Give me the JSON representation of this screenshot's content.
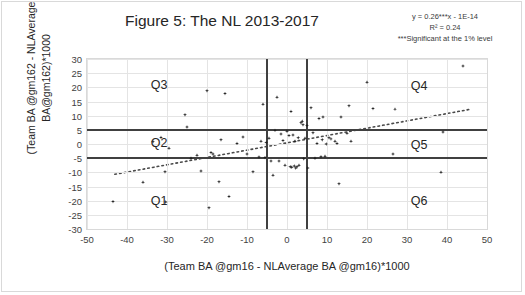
{
  "title": "Figure 5: The NL 2013-2017",
  "annotation": {
    "equation": "y = 0.26***x - 1E-14",
    "r_squared": "R² = 0.24",
    "significance": "***Significant at the 1% level"
  },
  "axis_titles": {
    "y_line1": "(Team BA @gm162 - NLAverage",
    "y_line2": "BA@gm162)*1000",
    "x": "(Team BA @gm16 - NLAverage BA @gm16)*1000"
  },
  "quadrant_labels": [
    {
      "name": "Q3",
      "text": "Q3",
      "x": -32,
      "y": 21
    },
    {
      "name": "Q2",
      "text": "Q2",
      "x": -32,
      "y": 0.5
    },
    {
      "name": "Q1",
      "text": "Q1",
      "x": -32,
      "y": -20
    },
    {
      "name": "Q4",
      "text": "Q4",
      "x": 33,
      "y": 20.5
    },
    {
      "name": "Q5",
      "text": "Q5",
      "x": 33,
      "y": -0.5
    },
    {
      "name": "Q6",
      "text": "Q6",
      "x": 33,
      "y": -20
    }
  ],
  "chart_data": {
    "type": "scatter",
    "title": "Figure 5: The NL 2013-2017",
    "xlabel": "(Team BA @gm16 - NLAverage BA @gm16)*1000",
    "ylabel": "(Team BA @gm162 - NLAverage BA@gm162)*1000",
    "xlim": [
      -50,
      50
    ],
    "ylim": [
      -30,
      30
    ],
    "xticks": [
      -50,
      -40,
      -30,
      -20,
      -10,
      0,
      10,
      20,
      30,
      40,
      50
    ],
    "yticks": [
      -30,
      -25,
      -20,
      -15,
      -10,
      -5,
      0,
      5,
      10,
      15,
      20,
      25,
      30
    ],
    "grid": true,
    "legend": false,
    "marker": "diamond",
    "marker_color": "#1a1a1a",
    "reference_lines": {
      "horizontal": [
        5,
        -5
      ],
      "vertical": [
        -5,
        5
      ],
      "color": "#404040"
    },
    "trendline": {
      "style": "dotted",
      "color": "#4a4a4a",
      "slope": 0.26,
      "intercept": 0,
      "equation": "y = 0.26***x - 1E-14",
      "r_squared": 0.24,
      "x_start": -43,
      "x_end": 46
    },
    "points": [
      [
        -43.5,
        -20.3
      ],
      [
        -36.0,
        -13.5
      ],
      [
        -33.5,
        0.8
      ],
      [
        -31.5,
        2.3
      ],
      [
        -30.5,
        -9.8
      ],
      [
        -30.3,
        -20.5
      ],
      [
        -29.5,
        -1.5
      ],
      [
        -25.5,
        10.3
      ],
      [
        -25.0,
        6.0
      ],
      [
        -24.0,
        -5.0
      ],
      [
        -22.5,
        -4.0
      ],
      [
        -21.5,
        -9.5
      ],
      [
        -20.0,
        18.8
      ],
      [
        -19.5,
        -22.5
      ],
      [
        -19.0,
        -3.0
      ],
      [
        -18.5,
        -3.5
      ],
      [
        -17.0,
        -13.3
      ],
      [
        -16.5,
        1.5
      ],
      [
        -15.5,
        17.8
      ],
      [
        -14.5,
        -18.5
      ],
      [
        -12.5,
        0.2
      ],
      [
        -11.0,
        2.5
      ],
      [
        -10.0,
        -3.5
      ],
      [
        -8.5,
        -9.8
      ],
      [
        -7.0,
        -4.6
      ],
      [
        -6.5,
        1.0
      ],
      [
        -6.0,
        14.0
      ],
      [
        -5.5,
        -4.8
      ],
      [
        -5.2,
        0.5
      ],
      [
        -4.5,
        2.0
      ],
      [
        -4.0,
        -6.0
      ],
      [
        -3.5,
        -11.0
      ],
      [
        -3.0,
        4.8
      ],
      [
        -2.5,
        16.5
      ],
      [
        -2.0,
        -6.0
      ],
      [
        -1.5,
        3.5
      ],
      [
        -1.0,
        1.2
      ],
      [
        -0.5,
        -7.5
      ],
      [
        0.0,
        4.5
      ],
      [
        0.5,
        3.0
      ],
      [
        0.8,
        -8.0
      ],
      [
        1.0,
        11.5
      ],
      [
        1.2,
        -8.2
      ],
      [
        1.5,
        3.2
      ],
      [
        1.8,
        -7.8
      ],
      [
        2.0,
        1.0
      ],
      [
        2.2,
        -8.5
      ],
      [
        2.5,
        -8.0
      ],
      [
        2.8,
        2.2
      ],
      [
        3.0,
        -7.5
      ],
      [
        3.5,
        7.5
      ],
      [
        3.8,
        8.0
      ],
      [
        4.0,
        6.8
      ],
      [
        4.2,
        -5.2
      ],
      [
        4.5,
        2.0
      ],
      [
        5.0,
        6.5
      ],
      [
        5.2,
        -8.5
      ],
      [
        6.0,
        12.8
      ],
      [
        6.5,
        4.0
      ],
      [
        7.0,
        -5.0
      ],
      [
        7.5,
        0.2
      ],
      [
        8.0,
        9.0
      ],
      [
        8.5,
        -4.5
      ],
      [
        8.8,
        1.5
      ],
      [
        9.0,
        9.5
      ],
      [
        9.5,
        -4.3
      ],
      [
        9.8,
        0.0
      ],
      [
        10.5,
        2.2
      ],
      [
        11.0,
        1.8
      ],
      [
        12.0,
        1.0
      ],
      [
        12.5,
        0.2
      ],
      [
        13.0,
        -14.0
      ],
      [
        13.5,
        9.5
      ],
      [
        15.0,
        3.8
      ],
      [
        15.5,
        13.5
      ],
      [
        16.0,
        1.0
      ],
      [
        20.0,
        21.8
      ],
      [
        21.5,
        12.5
      ],
      [
        26.5,
        -3.5
      ],
      [
        27.0,
        12.3
      ],
      [
        38.5,
        -10.0
      ],
      [
        39.0,
        4.2
      ],
      [
        44.0,
        27.5
      ]
    ]
  }
}
